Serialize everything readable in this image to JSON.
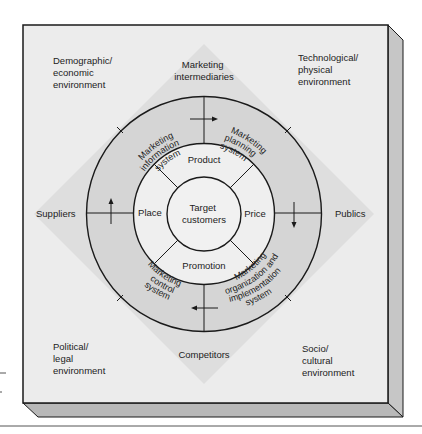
{
  "diagram": {
    "type": "concentric-environment-diagram",
    "colors": {
      "box_fill": "#ececec",
      "diamond_fill": "#dcdcdc",
      "outer_ring_fill": "#d4d4d4",
      "mix_ring_fill": "#efefef",
      "center_fill": "#f0f0f0",
      "side_fill": "#c4c4c4",
      "bottom_fill": "#b8b8b8",
      "line": "#1a1a1a"
    },
    "corners": {
      "top_left": [
        "Demographic/",
        "economic",
        "environment"
      ],
      "top_right": [
        "Technological/",
        "physical",
        "environment"
      ],
      "bottom_left": [
        "Political/",
        "legal",
        "environment"
      ],
      "bottom_right": [
        "Socio/",
        "cultural",
        "environment"
      ]
    },
    "actors": {
      "top": [
        "Marketing",
        "intermediaries"
      ],
      "left": "Suppliers",
      "right": "Publics",
      "bottom": "Competitors"
    },
    "systems_ring": {
      "top_left": [
        "Marketing",
        "information",
        "system"
      ],
      "top_right": [
        "Marketing",
        "planning",
        "system"
      ],
      "bottom_left": [
        "Marketing",
        "control",
        "system"
      ],
      "bottom_right": [
        "Marketing",
        "organization and",
        "implementation",
        "system"
      ]
    },
    "marketing_mix": {
      "top": "Product",
      "right": "Price",
      "bottom": "Promotion",
      "left": "Place"
    },
    "center": [
      "Target",
      "customers"
    ]
  }
}
